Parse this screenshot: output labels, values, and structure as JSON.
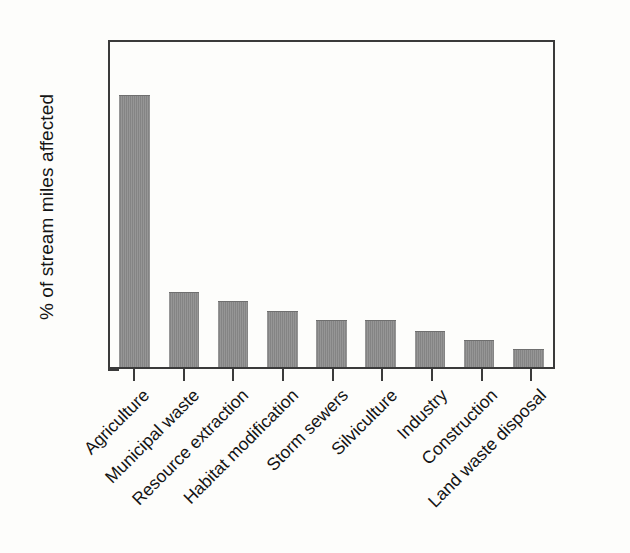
{
  "chart_data": {
    "type": "bar",
    "title": "",
    "xlabel": "",
    "ylabel": "% of stream miles affected",
    "ylim": [
      0,
      70
    ],
    "yticks": [
      0,
      10,
      20,
      30,
      40,
      50,
      60,
      70
    ],
    "grid": false,
    "legend": null,
    "bar_color": "#8a8a8a",
    "axis_color": "#3a3a3a",
    "background_color": "#fdfdfb",
    "categories": [
      "Agriculture",
      "Municipal waste",
      "Resource extraction",
      "Habitat modification",
      "Storm sewers",
      "Silviculture",
      "Industry",
      "Construction",
      "Land waste disposal"
    ],
    "values": [
      57.8,
      16.0,
      14.0,
      12.0,
      10.0,
      10.0,
      7.7,
      5.7,
      3.8
    ]
  }
}
